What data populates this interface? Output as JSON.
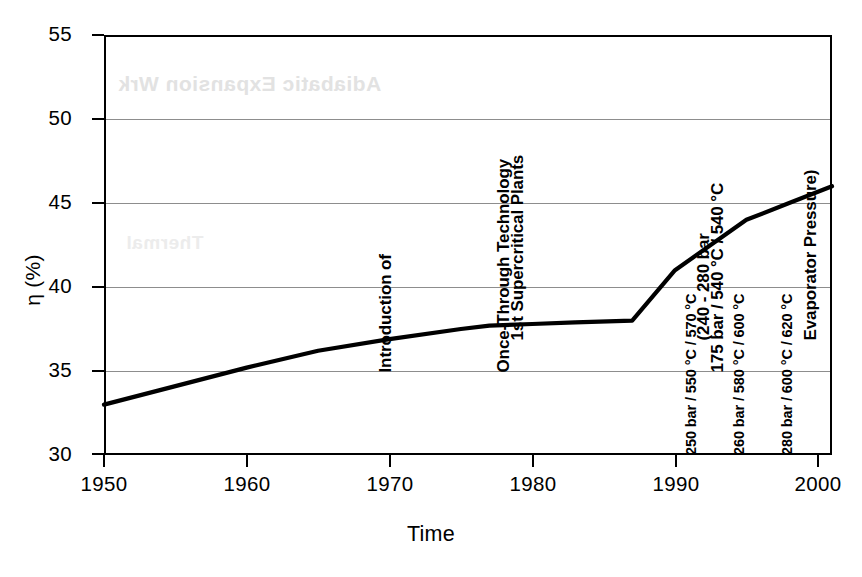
{
  "chart_data": {
    "type": "line",
    "title": "",
    "xlabel": "Time",
    "ylabel": "η (%)",
    "xlim": [
      1950,
      2001
    ],
    "ylim": [
      30,
      55
    ],
    "xticks": [
      1950,
      1960,
      1970,
      1980,
      1990,
      2000
    ],
    "yticks": [
      30,
      35,
      40,
      45,
      50,
      55
    ],
    "grid": "horizontal",
    "legend": "none",
    "series": [
      {
        "name": "Power plant net efficiency",
        "x": [
          1950,
          1955,
          1960,
          1965,
          1970,
          1975,
          1977,
          1980,
          1983,
          1987,
          1990,
          1995,
          1998,
          2001
        ],
        "values": [
          33.0,
          34.1,
          35.2,
          36.2,
          36.9,
          37.5,
          37.7,
          37.8,
          37.9,
          38.0,
          41.0,
          44.0,
          45.0,
          46.0
        ]
      }
    ],
    "annotations": [
      {
        "id": "once-through-technology",
        "x": 1971,
        "lines": [
          "Introduction of",
          "Once-Through Technology",
          "175 bar / 540 °C / 540 °C"
        ]
      },
      {
        "id": "first-supercritical-plants",
        "x": 1980,
        "lines": [
          "1st Supercritical Plants",
          "(240 - 280 bar",
          "Evaporator Pressure)"
        ]
      },
      {
        "id": "steam-parameters-1990",
        "x": 1992,
        "lines": [
          "250 bar / 550 °C / 570 °C"
        ]
      },
      {
        "id": "steam-parameters-1995",
        "x": 1995,
        "lines": [
          "260 bar / 580 °C / 600 °C"
        ]
      },
      {
        "id": "steam-parameters-1998",
        "x": 1998,
        "lines": [
          "280 bar / 600 °C / 620 °C"
        ]
      }
    ]
  },
  "axes": {
    "y_title": "η (%)",
    "x_title": "Time",
    "y_labels": [
      "55",
      "50",
      "45",
      "40",
      "35",
      "30"
    ],
    "x_labels": [
      "1950",
      "1960",
      "1970",
      "1980",
      "1990",
      "2000"
    ]
  },
  "annotation_text": {
    "once_through": {
      "line1": "Introduction of",
      "line2": "Once-Through Technology",
      "line3": "175 bar / 540 °C / 540 °C"
    },
    "supercritical": {
      "line1": "1st Supercritical Plants",
      "line2": "(240 - 280 bar",
      "line3": "Evaporator Pressure)"
    },
    "params_1990": "250 bar / 550 °C / 570 °C",
    "params_1995": "260 bar / 580 °C / 600 °C",
    "params_1998": "280 bar / 600 °C / 620 °C"
  },
  "artifact": {
    "bleed_main": "Adiabatic Expansion Wrk",
    "bleed_secondary": "Thermal"
  },
  "colors": {
    "curve": "#000000",
    "frame": "#000000",
    "gridline": "#8d8d8d",
    "background": "#ffffff",
    "bleed": "#e2e2e2"
  }
}
